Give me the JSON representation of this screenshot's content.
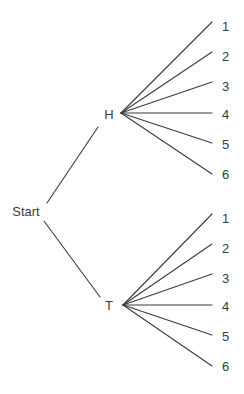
{
  "diagram": {
    "type": "tree",
    "background_color": "#ffffff",
    "line_color": "#3b3b3b",
    "text_color": "#3b3b3b",
    "root": {
      "id": "start",
      "label": "Start",
      "x": 26,
      "y": 211
    },
    "level1": [
      {
        "id": "h",
        "label": "H",
        "label_x": 109,
        "label_y": 114,
        "fan_x": 121,
        "fan_y": 113,
        "edge_from_x": 47,
        "edge_from_y": 203,
        "edge_to_x": 98,
        "edge_to_y": 127
      },
      {
        "id": "t",
        "label": "T",
        "label_x": 109,
        "label_y": 305,
        "fan_x": 123,
        "fan_y": 305,
        "edge_from_x": 44,
        "edge_from_y": 221,
        "edge_to_x": 100,
        "edge_to_y": 297
      }
    ],
    "leaves_h": [
      {
        "label": "1",
        "line_end_x": 212,
        "line_end_y": 22,
        "label_x": 222,
        "label_y": 26
      },
      {
        "label": "2",
        "line_end_x": 212,
        "line_end_y": 52,
        "label_x": 222,
        "label_y": 56
      },
      {
        "label": "3",
        "line_end_x": 212,
        "line_end_y": 82,
        "label_x": 222,
        "label_y": 86
      },
      {
        "label": "4",
        "line_end_x": 212,
        "line_end_y": 113,
        "label_x": 222,
        "label_y": 114
      },
      {
        "label": "5",
        "line_end_x": 212,
        "line_end_y": 143,
        "label_x": 222,
        "label_y": 144
      },
      {
        "label": "6",
        "line_end_x": 212,
        "line_end_y": 174,
        "label_x": 222,
        "label_y": 174
      }
    ],
    "leaves_t": [
      {
        "label": "1",
        "line_end_x": 212,
        "line_end_y": 214,
        "label_x": 222,
        "label_y": 218
      },
      {
        "label": "2",
        "line_end_x": 212,
        "line_end_y": 244,
        "label_x": 222,
        "label_y": 248
      },
      {
        "label": "3",
        "line_end_x": 212,
        "line_end_y": 274,
        "label_x": 222,
        "label_y": 278
      },
      {
        "label": "4",
        "line_end_x": 212,
        "line_end_y": 305,
        "label_x": 222,
        "label_y": 306
      },
      {
        "label": "5",
        "line_end_x": 212,
        "line_end_y": 335,
        "label_x": 222,
        "label_y": 336
      },
      {
        "label": "6",
        "line_end_x": 212,
        "line_end_y": 366,
        "label_x": 222,
        "label_y": 366
      }
    ]
  }
}
